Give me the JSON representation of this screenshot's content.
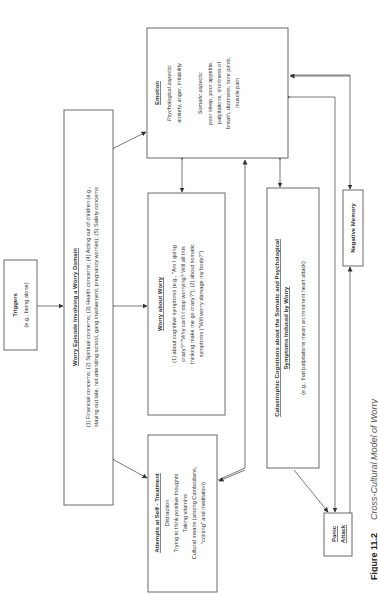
{
  "caption": {
    "label": "Figure 11.2",
    "title": "Cross-Cultural Model of Worry"
  },
  "nodes": {
    "triggers": {
      "title": "Triggers",
      "lines": [
        "(e.g., being alone)"
      ]
    },
    "worry_episode": {
      "title": "Worry Episode Involving a Worry Domain",
      "lines": [
        "(1) Financial concerns; (2) Spiritual concerns; (3) Health concerns; (4) Acting out of children (e.g.,",
        "staying out late, not attending school, gang involvement, pregnancy worries); (5) Safety concerns"
      ]
    },
    "emotion": {
      "title": "Emotion",
      "psych_label": "Psychological aspects:",
      "psych_lines": [
        "anxiety, anger, irritability"
      ],
      "somatic_label": "Somatic aspects:",
      "somatic_lines": [
        "poor sleep, poor appetite,",
        "palpitations, shortness of",
        "breath, dizziness, sore joints,",
        "muscle pain"
      ]
    },
    "worry_about_worry": {
      "title": "Worry about Worry",
      "lines": [
        "(1) about cognitive symptoms (e.g., \"Am I going",
        "crazy?\" \"Why can't I stop worrying? Will all this",
        "thinking make me go crazy?\"); (2) about somatic",
        "symptoms (\"Will worry damage my body?\")"
      ]
    },
    "self_treatment": {
      "title": "Attempts at Self - Treatment",
      "lines": [
        "Distraction",
        "Trying to think positive thoughts",
        "Taking vitamins",
        "Cultural means (among Cambodians,",
        "\"coining\" and meditation)"
      ]
    },
    "catastrophic": {
      "title_lines": [
        "Catastrophic Cognitions about the Somatic and Psychological",
        "Symptoms Induced by Worry"
      ],
      "lines": [
        "(e.g., that palpitations mean an imminent heart attack)"
      ]
    },
    "negative_memory": {
      "title": "Negative Memory"
    },
    "panic_attack": {
      "title_lines": [
        "Panic",
        "Attack"
      ]
    }
  }
}
